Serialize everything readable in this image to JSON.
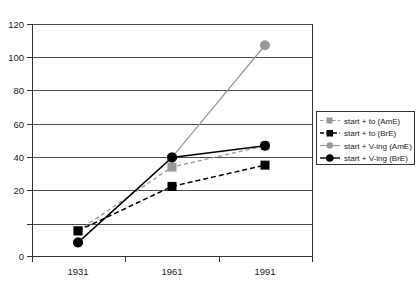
{
  "chart_data": {
    "type": "line",
    "title": "",
    "xlabel": "",
    "ylabel": "",
    "categories": [
      "1931",
      "1961",
      "1991"
    ],
    "x_tick_labels": [
      "1931",
      "1961",
      "1991"
    ],
    "y_tick_labels": [
      "0",
      "20",
      "40",
      "60",
      "80",
      "100",
      "120"
    ],
    "y_ticks": [
      0,
      20,
      40,
      60,
      80,
      100,
      120
    ],
    "ylim": [
      0,
      120
    ],
    "grid": "horizontal",
    "legend_position": "right",
    "series": [
      {
        "name": "start + to (AmE)",
        "values": [
          13,
          46,
          57
        ],
        "color": "#999999",
        "line_style": "dashed",
        "marker": "square"
      },
      {
        "name": "start + to (BrE)",
        "values": [
          13,
          36,
          47
        ],
        "color": "#000000",
        "line_style": "dashed",
        "marker": "square"
      },
      {
        "name": "start + V-ing (AmE)",
        "values": [
          7,
          51,
          109
        ],
        "color": "#999999",
        "line_style": "solid",
        "marker": "circle"
      },
      {
        "name": "start + V-ing (BrE)",
        "values": [
          7,
          51,
          57
        ],
        "color": "#000000",
        "line_style": "solid",
        "marker": "circle"
      }
    ]
  },
  "legend": {
    "items": [
      {
        "label": "start + to (AmE)"
      },
      {
        "label": "start + to (BrE)"
      },
      {
        "label": "start + V-ing (AmE)"
      },
      {
        "label": "start + V-ing (BrE)"
      }
    ]
  },
  "axes": {
    "y_labels": [
      "120",
      "100",
      "80",
      "60",
      "40",
      "20",
      "0"
    ],
    "x_labels": [
      "1931",
      "1961",
      "1991"
    ]
  },
  "colors": {
    "amE": "#999999",
    "brE": "#000000",
    "grid": "#4d4d4d",
    "axis": "#333333",
    "background": "#ffffff"
  }
}
